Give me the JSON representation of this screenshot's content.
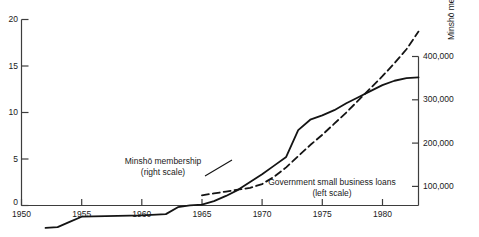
{
  "chart_data": {
    "type": "line",
    "title": "",
    "xlabel": "",
    "ylabel": "",
    "grid": false,
    "legend_position": "inline-annotations",
    "x_axis": {
      "min": 1950,
      "max": 1983,
      "ticks": [
        1950,
        1955,
        1960,
        1965,
        1970,
        1975,
        1980
      ],
      "tick_labels": [
        "1950",
        "1955",
        "1960",
        "1965",
        "1970",
        "1975",
        "1980"
      ]
    },
    "y_left": {
      "label": "",
      "min": 0,
      "max": 20,
      "ticks": [
        0,
        5,
        10,
        15,
        20
      ],
      "tick_labels": [
        "0",
        "5",
        "10",
        "15",
        "20"
      ]
    },
    "y_right": {
      "label": "Minshō membership",
      "min": 0,
      "max": 400000,
      "ticks": [
        100000,
        200000,
        300000,
        400000
      ],
      "tick_labels": [
        "100,000",
        "200,000",
        "300,000",
        "400,000"
      ]
    },
    "series": [
      {
        "name": "Minshō membership",
        "scale": "right",
        "style": "solid",
        "color": "#141414",
        "annotation": "Minshō membership\n(right scale)",
        "x": [
          1952,
          1953,
          1954,
          1955,
          1956,
          1958,
          1960,
          1962,
          1963,
          1964,
          1965,
          1966,
          1967,
          1968,
          1969,
          1970,
          1971,
          1972,
          1973,
          1974,
          1975,
          1976,
          1977,
          1978,
          1979,
          1980,
          1981,
          1982,
          1983
        ],
        "values": [
          4000,
          6000,
          18000,
          30000,
          31000,
          32000,
          33000,
          36000,
          52000,
          56000,
          58000,
          66000,
          78000,
          92000,
          110000,
          128000,
          148000,
          168000,
          230000,
          254000,
          264000,
          276000,
          292000,
          306000,
          320000,
          334000,
          344000,
          350000,
          352000
        ]
      },
      {
        "name": "Government small business loans",
        "scale": "left",
        "style": "dashed",
        "color": "#141414",
        "annotation": "Government small business loans\n(left scale)",
        "x": [
          1965,
          1966,
          1967,
          1968,
          1969,
          1970,
          1971,
          1972,
          1973,
          1974,
          1975,
          1976,
          1977,
          1978,
          1979,
          1980,
          1981,
          1982,
          1983
        ],
        "values": [
          1.1,
          1.3,
          1.5,
          1.7,
          1.9,
          2.3,
          3.1,
          4.1,
          5.3,
          6.5,
          7.6,
          8.8,
          10.0,
          11.3,
          12.6,
          13.9,
          15.3,
          16.8,
          18.7
        ]
      }
    ],
    "annotations": [
      {
        "name": "minsho-annotation",
        "line1": "Minshō membership",
        "line2": "(right scale)"
      },
      {
        "name": "loans-annotation",
        "line1": "Government small business loans",
        "line2": "(left scale)"
      }
    ]
  }
}
